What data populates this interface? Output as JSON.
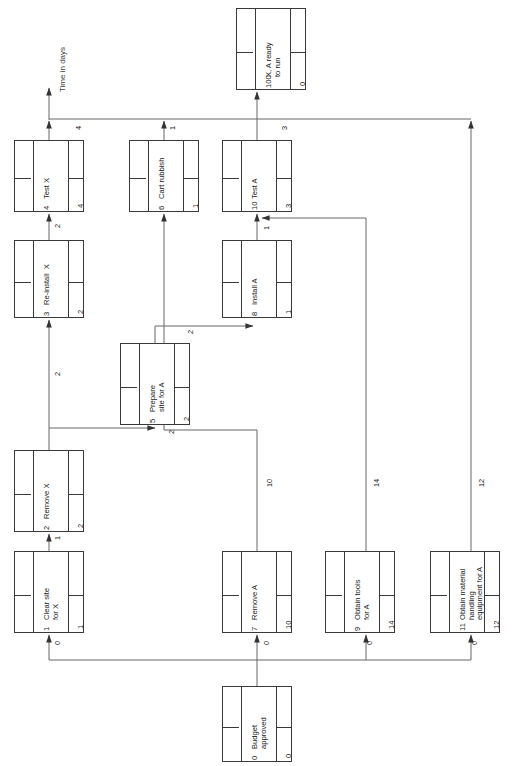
{
  "diagram": {
    "axis_label": "Time in days",
    "orientation": "rotated-90-ccw",
    "line_color": "#555555",
    "box_color": "#3a3a3a"
  },
  "nodes": [
    {
      "id": "n100",
      "number": "100",
      "label": "X, A ready\nto run",
      "duration": "0",
      "x": 236,
      "y": 8,
      "w": 70,
      "h": 82
    },
    {
      "id": "n4",
      "number": "4",
      "label": "Test X",
      "duration": "4",
      "x": 14,
      "y": 140,
      "w": 70,
      "h": 72
    },
    {
      "id": "n6",
      "number": "6",
      "label": "Cart rubbish",
      "duration": "1",
      "x": 129,
      "y": 140,
      "w": 70,
      "h": 72
    },
    {
      "id": "n10",
      "number": "10",
      "label": "Test A",
      "duration": "3",
      "x": 222,
      "y": 140,
      "w": 70,
      "h": 72
    },
    {
      "id": "n3",
      "number": "3",
      "label": "Re-install  X",
      "duration": "2",
      "x": 14,
      "y": 240,
      "w": 70,
      "h": 78
    },
    {
      "id": "n8",
      "number": "8",
      "label": "Install A",
      "duration": "1",
      "x": 222,
      "y": 240,
      "w": 70,
      "h": 78
    },
    {
      "id": "n5",
      "number": "5",
      "label": "Prepare\nsite for A",
      "duration": "2",
      "x": 120,
      "y": 343,
      "w": 70,
      "h": 82
    },
    {
      "id": "n2",
      "number": "2",
      "label": "Remove X",
      "duration": "2",
      "x": 14,
      "y": 450,
      "w": 70,
      "h": 82
    },
    {
      "id": "n1",
      "number": "1",
      "label": "Clear site\nfor X",
      "duration": "1",
      "x": 14,
      "y": 551,
      "w": 70,
      "h": 82
    },
    {
      "id": "n7",
      "number": "7",
      "label": "Remove A",
      "duration": "10",
      "x": 222,
      "y": 551,
      "w": 70,
      "h": 82
    },
    {
      "id": "n9",
      "number": "9",
      "label": "Obtain tools\nfor A",
      "duration": "14",
      "x": 325,
      "y": 551,
      "w": 70,
      "h": 82
    },
    {
      "id": "n11",
      "number": "11",
      "label": "Obtain material\nhandling\nequipment for A",
      "duration": "12",
      "x": 430,
      "y": 551,
      "w": 70,
      "h": 82
    },
    {
      "id": "n0",
      "number": "0",
      "label": "Budget\napproved",
      "duration": "0",
      "x": 222,
      "y": 686,
      "w": 70,
      "h": 76
    }
  ],
  "edges": [
    {
      "id": "e0-1",
      "from": "0",
      "to": "1",
      "label": "0"
    },
    {
      "id": "e0-7",
      "from": "0",
      "to": "7",
      "label": "0"
    },
    {
      "id": "e0-9",
      "from": "0",
      "to": "9",
      "label": "0"
    },
    {
      "id": "e0-11",
      "from": "0",
      "to": "11",
      "label": "0"
    },
    {
      "id": "e1-2",
      "from": "1",
      "to": "2",
      "label": "1"
    },
    {
      "id": "e2-3",
      "from": "2",
      "to": "3",
      "label": "2"
    },
    {
      "id": "e2-5",
      "from": "2",
      "to": "5",
      "label": "2"
    },
    {
      "id": "e3-4",
      "from": "3",
      "to": "4",
      "label": "2"
    },
    {
      "id": "e4-100",
      "from": "4",
      "to": "100",
      "label": "4"
    },
    {
      "id": "e5-8",
      "from": "5",
      "to": "8",
      "label": "2"
    },
    {
      "id": "e6-100",
      "from": "6",
      "to": "100",
      "label": "1"
    },
    {
      "id": "e7-6",
      "from": "7",
      "to": "6",
      "label": "10"
    },
    {
      "id": "e8-10",
      "from": "8",
      "to": "10",
      "label": "1"
    },
    {
      "id": "e9-10",
      "from": "9",
      "to": "10",
      "label": "14"
    },
    {
      "id": "e10-100",
      "from": "10",
      "to": "100",
      "label": "3"
    },
    {
      "id": "e11-100",
      "from": "11",
      "to": "100",
      "label": "12"
    }
  ],
  "edge_label_positions": [
    {
      "id": "lbl-4-100",
      "text": "4",
      "x": 74,
      "y": 130
    },
    {
      "id": "lbl-6-100",
      "text": "1",
      "x": 168,
      "y": 130
    },
    {
      "id": "lbl-10-100",
      "text": "3",
      "x": 280,
      "y": 130
    },
    {
      "id": "lbl-11-100",
      "text": "12",
      "x": 477,
      "y": 487
    },
    {
      "id": "lbl-3-4",
      "text": "2",
      "x": 53,
      "y": 228
    },
    {
      "id": "lbl-8-10",
      "text": "1",
      "x": 262,
      "y": 230
    },
    {
      "id": "lbl-9-10",
      "text": "14",
      "x": 372,
      "y": 487
    },
    {
      "id": "lbl-2-3",
      "text": "2",
      "x": 53,
      "y": 376
    },
    {
      "id": "lbl-5-8",
      "text": "2",
      "x": 186,
      "y": 334
    },
    {
      "id": "lbl-2-5",
      "text": "2",
      "x": 167,
      "y": 434
    },
    {
      "id": "lbl-7-6",
      "text": "10",
      "x": 265,
      "y": 487
    },
    {
      "id": "lbl-1-2",
      "text": "1",
      "x": 53,
      "y": 540
    },
    {
      "id": "lbl-0-1",
      "text": "0",
      "x": 53,
      "y": 645
    },
    {
      "id": "lbl-0-7",
      "text": "0",
      "x": 262,
      "y": 645
    },
    {
      "id": "lbl-0-9",
      "text": "0",
      "x": 365,
      "y": 645
    },
    {
      "id": "lbl-0-11",
      "text": "0",
      "x": 470,
      "y": 645
    }
  ],
  "axis": {
    "label_x": 52,
    "label_y": 92
  }
}
